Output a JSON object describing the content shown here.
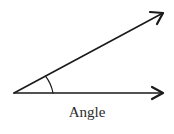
{
  "diagram": {
    "title": "Angle",
    "label": "Angle",
    "stroke_color": "#1a1a1a",
    "vertex": [
      14,
      93
    ],
    "rays": [
      {
        "name": "upper-ray",
        "end": [
          163,
          13
        ]
      },
      {
        "name": "horizontal-ray",
        "end": [
          163,
          93
        ]
      }
    ],
    "arc_radius": 39
  }
}
